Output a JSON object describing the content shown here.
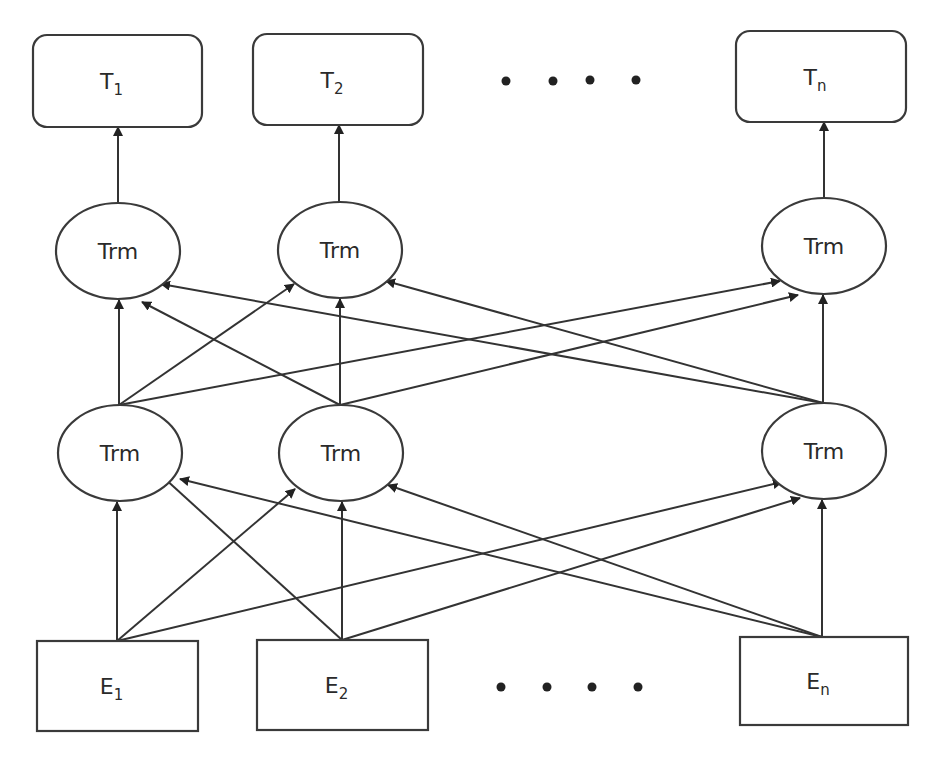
{
  "diagram": {
    "type": "bert-architecture",
    "colors": {
      "stroke": "#3a3a3a",
      "edge": "#333333",
      "text": "#2a2a2a",
      "background": "#ffffff"
    },
    "outputs": [
      {
        "id": "T1",
        "base": "T",
        "sub": "1",
        "x": 33,
        "y": 35,
        "w": 169,
        "h": 92
      },
      {
        "id": "T2",
        "base": "T",
        "sub": "2",
        "x": 253,
        "y": 34,
        "w": 170,
        "h": 91
      },
      {
        "id": "Tn",
        "base": "T",
        "sub": "n",
        "x": 736,
        "y": 31,
        "w": 170,
        "h": 91
      }
    ],
    "upper_layer": [
      {
        "id": "U1",
        "label": "Trm",
        "cx": 118,
        "cy": 251,
        "rx": 62,
        "ry": 48
      },
      {
        "id": "U2",
        "label": "Trm",
        "cx": 340,
        "cy": 250,
        "rx": 62,
        "ry": 48
      },
      {
        "id": "Un",
        "label": "Trm",
        "cx": 824,
        "cy": 246,
        "rx": 62,
        "ry": 48
      }
    ],
    "lower_layer": [
      {
        "id": "L1",
        "label": "Trm",
        "cx": 120,
        "cy": 453,
        "rx": 62,
        "ry": 48
      },
      {
        "id": "L2",
        "label": "Trm",
        "cx": 341,
        "cy": 453,
        "rx": 62,
        "ry": 48
      },
      {
        "id": "Ln",
        "label": "Trm",
        "cx": 824,
        "cy": 451,
        "rx": 62,
        "ry": 48
      }
    ],
    "inputs": [
      {
        "id": "E1",
        "base": "E",
        "sub": "1",
        "x": 37,
        "y": 641,
        "w": 161,
        "h": 90
      },
      {
        "id": "E2",
        "base": "E",
        "sub": "2",
        "x": 257,
        "y": 640,
        "w": 171,
        "h": 90
      },
      {
        "id": "En",
        "base": "E",
        "sub": "n",
        "x": 740,
        "y": 637,
        "w": 168,
        "h": 88
      }
    ],
    "ellipsis_top": [
      [
        506,
        81
      ],
      [
        553,
        81
      ],
      [
        590,
        80
      ],
      [
        636,
        80
      ]
    ],
    "ellipsis_bottom": [
      [
        501,
        687
      ],
      [
        547,
        687
      ],
      [
        592,
        687
      ],
      [
        638,
        687
      ]
    ],
    "edges": [
      {
        "from": [
          117,
          641
        ],
        "to": [
          117,
          502
        ]
      },
      {
        "from": [
          117,
          641
        ],
        "to": [
          295,
          489
        ]
      },
      {
        "from": [
          117,
          641
        ],
        "to": [
          782,
          482
        ]
      },
      {
        "from": [
          342,
          640
        ],
        "to": [
          163,
          477
        ]
      },
      {
        "from": [
          342,
          640
        ],
        "to": [
          342,
          502
        ]
      },
      {
        "from": [
          342,
          640
        ],
        "to": [
          800,
          498
        ]
      },
      {
        "from": [
          822,
          637
        ],
        "to": [
          180,
          479
        ]
      },
      {
        "from": [
          822,
          637
        ],
        "to": [
          388,
          485
        ]
      },
      {
        "from": [
          822,
          637
        ],
        "to": [
          822,
          500
        ]
      },
      {
        "from": [
          119,
          405
        ],
        "to": [
          119,
          300
        ]
      },
      {
        "from": [
          119,
          405
        ],
        "to": [
          294,
          284
        ]
      },
      {
        "from": [
          119,
          405
        ],
        "to": [
          780,
          281
        ]
      },
      {
        "from": [
          340,
          405
        ],
        "to": [
          142,
          302
        ]
      },
      {
        "from": [
          340,
          405
        ],
        "to": [
          340,
          299
        ]
      },
      {
        "from": [
          340,
          405
        ],
        "to": [
          798,
          295
        ]
      },
      {
        "from": [
          823,
          403
        ],
        "to": [
          161,
          284
        ]
      },
      {
        "from": [
          823,
          403
        ],
        "to": [
          386,
          281
        ]
      },
      {
        "from": [
          823,
          403
        ],
        "to": [
          823,
          295
        ]
      },
      {
        "from": [
          118,
          203
        ],
        "to": [
          118,
          127
        ]
      },
      {
        "from": [
          339,
          202
        ],
        "to": [
          339,
          125
        ]
      },
      {
        "from": [
          824,
          198
        ],
        "to": [
          824,
          122
        ]
      }
    ]
  }
}
